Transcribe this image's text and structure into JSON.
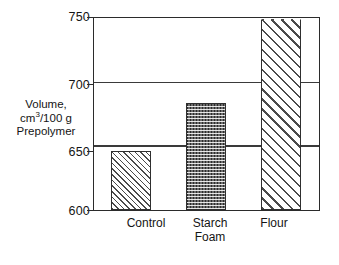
{
  "chart_data": {
    "type": "bar",
    "title": "",
    "xlabel": "",
    "ylabel": "Volume, cm3/100 g Prepolymer",
    "categories": [
      "Control",
      "Starch Foam",
      "Flour"
    ],
    "values": [
      646,
      684,
      750
    ],
    "ylim": [
      600,
      750
    ],
    "yticks": [
      600,
      650,
      700,
      750
    ],
    "grid": true,
    "legend": "none"
  },
  "axis": {
    "y_ticks": {
      "t750": "750",
      "t700": "700",
      "t650": "650",
      "t600": "600"
    },
    "y_title": {
      "line1": "Volume,",
      "line2_pre": "cm",
      "line2_sup": "3",
      "line2_post": "/100 g",
      "line3": "Prepolymer"
    }
  },
  "categories": {
    "control": {
      "line1": "Control",
      "line2": ""
    },
    "starch": {
      "line1": "Starch",
      "line2": "Foam"
    },
    "flour": {
      "line1": "Flour",
      "line2": ""
    }
  },
  "colors": {
    "frame": "#2b2b2b",
    "gridline": "#3a3a3a",
    "bar_outline": "#2f2f2f",
    "starch_fill": "#6d6d6d",
    "background": "#ffffff",
    "text": "#141414"
  }
}
